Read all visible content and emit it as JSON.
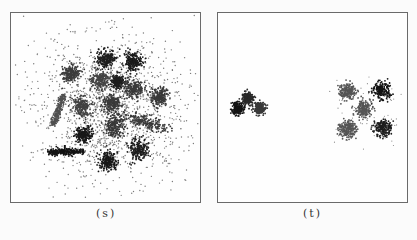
{
  "figure": {
    "panels": [
      {
        "id": "s",
        "caption": "(s)",
        "description": "dense noisy point cloud with many overlapping dark clusters",
        "clusters": [
          {
            "cx": 0.505,
            "cy": 0.245,
            "r": 0.045,
            "shade": "#1e1e1e"
          },
          {
            "cx": 0.645,
            "cy": 0.26,
            "r": 0.045,
            "shade": "#1a1a1a"
          },
          {
            "cx": 0.315,
            "cy": 0.32,
            "r": 0.04,
            "shade": "#3c3c3c"
          },
          {
            "cx": 0.47,
            "cy": 0.355,
            "r": 0.045,
            "shade": "#444444"
          },
          {
            "cx": 0.565,
            "cy": 0.365,
            "r": 0.03,
            "shade": "#1e1e1e"
          },
          {
            "cx": 0.65,
            "cy": 0.4,
            "r": 0.045,
            "shade": "#3a3a3a"
          },
          {
            "cx": 0.785,
            "cy": 0.44,
            "r": 0.045,
            "shade": "#3a3a3a"
          },
          {
            "cx": 0.375,
            "cy": 0.495,
            "r": 0.045,
            "shade": "#404040"
          },
          {
            "cx": 0.535,
            "cy": 0.475,
            "r": 0.045,
            "shade": "#3a3a3a"
          },
          {
            "cx": 0.71,
            "cy": 0.575,
            "r": 0.05,
            "shade": "#3a3a3a",
            "elongated": true
          },
          {
            "cx": 0.55,
            "cy": 0.6,
            "r": 0.05,
            "shade": "#383838"
          },
          {
            "cx": 0.385,
            "cy": 0.645,
            "r": 0.04,
            "shade": "#181818"
          },
          {
            "cx": 0.67,
            "cy": 0.72,
            "r": 0.05,
            "shade": "#1e1e1e"
          },
          {
            "cx": 0.515,
            "cy": 0.785,
            "r": 0.045,
            "shade": "#181818"
          },
          {
            "cx": 0.29,
            "cy": 0.735,
            "r": 0.06,
            "shade": "#141414",
            "bar": true
          },
          {
            "cx": 0.25,
            "cy": 0.515,
            "r": 0.05,
            "shade": "#505050",
            "diagonal": true
          }
        ],
        "noise_points": 1600,
        "noise_center": [
          0.52,
          0.5
        ],
        "noise_spread": 0.2
      },
      {
        "id": "t",
        "caption": "(t)",
        "description": "clean clusters: three dark on left, five on right",
        "clusters": [
          {
            "cx": 0.105,
            "cy": 0.505,
            "r": 0.03,
            "shade": "#141414"
          },
          {
            "cx": 0.16,
            "cy": 0.45,
            "r": 0.028,
            "shade": "#2a2a2a"
          },
          {
            "cx": 0.22,
            "cy": 0.505,
            "r": 0.028,
            "shade": "#3a3a3a"
          },
          {
            "cx": 0.685,
            "cy": 0.415,
            "r": 0.04,
            "shade": "#555555"
          },
          {
            "cx": 0.865,
            "cy": 0.41,
            "r": 0.04,
            "shade": "#141414"
          },
          {
            "cx": 0.77,
            "cy": 0.51,
            "r": 0.04,
            "shade": "#555555"
          },
          {
            "cx": 0.685,
            "cy": 0.615,
            "r": 0.04,
            "shade": "#555555"
          },
          {
            "cx": 0.875,
            "cy": 0.61,
            "r": 0.04,
            "shade": "#1e1e1e"
          }
        ],
        "noise_points": 0
      }
    ]
  }
}
